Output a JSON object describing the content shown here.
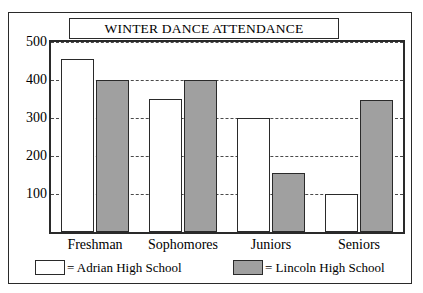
{
  "chart_data": {
    "type": "bar",
    "title": "WINTER DANCE ATTENDANCE",
    "xlabel": "",
    "ylabel": "",
    "ylim": [
      0,
      500
    ],
    "ytick_labels": [
      "500",
      "400",
      "300",
      "200",
      "100"
    ],
    "ytick_values": [
      500,
      400,
      300,
      200,
      100
    ],
    "grid": true,
    "legend_position": "bottom",
    "categories": [
      "Freshman",
      "Sophomores",
      "Juniors",
      "Seniors"
    ],
    "series": [
      {
        "name": "Adrian High School",
        "color": "#ffffff",
        "values": [
          455,
          350,
          300,
          100
        ]
      },
      {
        "name": "Lincoln High School",
        "color": "#a0a0a0",
        "values": [
          400,
          400,
          155,
          348
        ]
      }
    ]
  },
  "legend": {
    "entries": [
      {
        "swatch": "white-swatch",
        "label": "= Adrian High School"
      },
      {
        "swatch": "gray-swatch",
        "label": "= Lincoln High School"
      }
    ]
  },
  "colors": {
    "line": "#2a2a2a",
    "adrian_fill": "#ffffff",
    "lincoln_fill": "#a0a0a0",
    "background": "#ffffff"
  }
}
